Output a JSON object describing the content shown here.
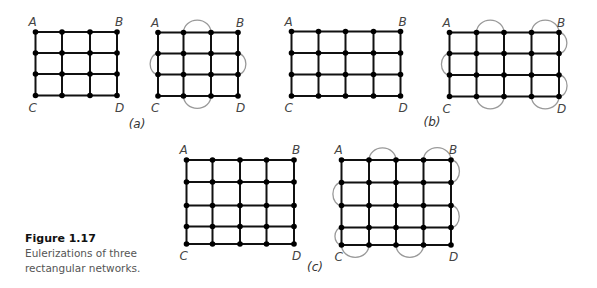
{
  "caption": {
    "figure_label": "Figure 1.17",
    "text": "Eulerizations of three rectangular networks."
  },
  "panels": [
    {
      "label": "(a)",
      "label_pos": [
        137,
        128
      ],
      "graphs": [
        {
          "xs": [
            35.5,
            62,
            90,
            117
          ],
          "ys": [
            32,
            53,
            74,
            95.5
          ],
          "arcs": []
        },
        {
          "xs": [
            158,
            183.5,
            211,
            238
          ],
          "ys": [
            32.5,
            53.5,
            74.5,
            96
          ],
          "arcs": [
            [
              "top",
              1
            ],
            [
              "bottom",
              1
            ],
            [
              "left",
              1
            ],
            [
              "right",
              1
            ]
          ]
        }
      ]
    },
    {
      "label": "(b)",
      "label_pos": [
        432,
        126
      ],
      "graphs": [
        {
          "xs": [
            291.5,
            318.5,
            345.5,
            373.5,
            400.5
          ],
          "ys": [
            31.5,
            53,
            74.5,
            96
          ],
          "arcs": []
        },
        {
          "xs": [
            449.5,
            476.5,
            504,
            531.5,
            559
          ],
          "ys": [
            32.5,
            53.5,
            75,
            96.5
          ],
          "arcs": [
            [
              "top",
              1
            ],
            [
              "top",
              3
            ],
            [
              "bottom",
              1
            ],
            [
              "bottom",
              3
            ],
            [
              "left",
              1
            ],
            [
              "right",
              0
            ],
            [
              "right",
              2
            ]
          ]
        }
      ]
    },
    {
      "label": "(c)",
      "label_pos": [
        315,
        271
      ],
      "graphs": [
        {
          "xs": [
            186.5,
            212.5,
            240,
            266.5,
            294
          ],
          "ys": [
            160,
            182,
            205.5,
            226.5,
            244
          ],
          "arcs": []
        },
        {
          "xs": [
            341.5,
            369,
            396,
            423.5,
            451
          ],
          "ys": [
            160,
            182.5,
            205.5,
            227.5,
            245
          ],
          "arcs": [
            [
              "top",
              1
            ],
            [
              "top",
              3
            ],
            [
              "bottom",
              0
            ],
            [
              "bottom",
              2
            ],
            [
              "left",
              1
            ],
            [
              "left",
              3
            ],
            [
              "right",
              0
            ],
            [
              "right",
              2
            ]
          ]
        }
      ]
    }
  ],
  "corner_labels": [
    "A",
    "B",
    "C",
    "D"
  ]
}
